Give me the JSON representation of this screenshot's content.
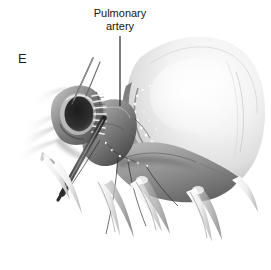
{
  "figure": {
    "panel_letter": "E",
    "background_color": "#ffffff",
    "ink_color": "#141414",
    "title_label": {
      "line1": "Pulmonary",
      "line2": "artery"
    },
    "leader_line": {
      "color": "#141414",
      "from_x": 120,
      "from_y": 36,
      "to_x": 120,
      "to_y": 106
    },
    "palette": {
      "lumen_dark": "#2a2a2a",
      "tissue_mid": "#8a8a8a",
      "tissue_light": "#e9e9e9",
      "dome_highlight": "#f6f6f6",
      "dome_shadow": "#b9b9b9",
      "suture_white": "#fdfdfd",
      "instrument_dark": "#3a3a3a",
      "crescent_grey": "#9a9a9a"
    },
    "structures": [
      {
        "name": "lung-dome",
        "description": "large pale smooth mass occupying right two thirds"
      },
      {
        "name": "crescent-ridge",
        "description": "darker speckled crescent along lower-left of dome"
      },
      {
        "name": "vessel-lumen",
        "description": "dark oval opening of cut pulmonary artery"
      },
      {
        "name": "anastomosis-sutures",
        "description": "vertical ladder of stitches at vessel edge"
      },
      {
        "name": "forceps-instrument",
        "description": "long dark instrument crossing lower left diagonally"
      },
      {
        "name": "needle-instrument",
        "description": "thin diagonal needle above vessel"
      },
      {
        "name": "clamp-tips",
        "description": "pale curved tapering forms hanging below the mass"
      },
      {
        "name": "feathered-tissue",
        "description": "soft grey strokes fading to white at far left"
      }
    ]
  }
}
